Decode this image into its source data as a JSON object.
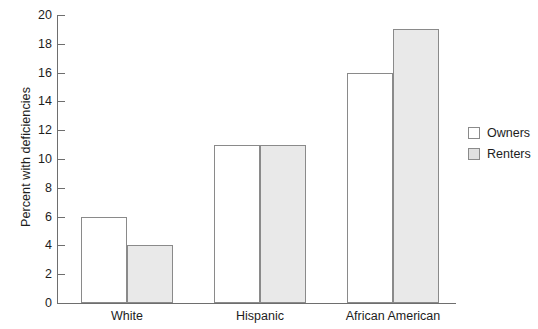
{
  "chart_data": {
    "type": "bar",
    "title": "",
    "xlabel": "",
    "ylabel": "Percent with deficiencies",
    "categories": [
      "White",
      "Hispanic",
      "African American"
    ],
    "series": [
      {
        "name": "Owners",
        "values": [
          6,
          4,
          0
        ]
      },
      {
        "name": "Renters",
        "values": [
          4,
          11,
          19
        ]
      }
    ],
    "series_corrected": [
      {
        "name": "Owners",
        "values": [
          6,
          11,
          16
        ]
      },
      {
        "name": "Renters",
        "values": [
          4,
          11,
          19
        ]
      }
    ],
    "ylim": [
      0,
      20
    ],
    "ytick_step": 2,
    "yticks": [
      0,
      2,
      4,
      6,
      8,
      10,
      12,
      14,
      16,
      18,
      20
    ],
    "ytick_labels": [
      "0",
      "2",
      "4",
      "6",
      "8",
      "10",
      "12",
      "14",
      "16",
      "18",
      "20"
    ],
    "grid": false,
    "legend_position": "right",
    "legend": [
      "Owners",
      "Renters"
    ],
    "colors": {
      "owners_fill": "#ffffff",
      "renters_fill": "#e9e9e9",
      "bar_stroke": "#8a8a8a",
      "axis": "#6e6e6e",
      "text": "#1d1d1d"
    }
  },
  "legend": {
    "items": [
      {
        "label": "Owners",
        "swatch": "legend-swatch-owners"
      },
      {
        "label": "Renters",
        "swatch": "legend-swatch-renters"
      }
    ]
  }
}
